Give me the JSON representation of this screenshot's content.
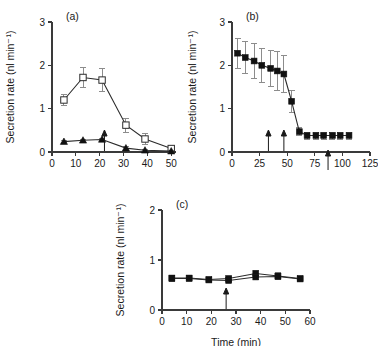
{
  "figure": {
    "axis_label_y": "Secretion rate (nl min⁻¹)",
    "axis_label_x": "Time (min)",
    "panels": [
      "(a)",
      "(b)",
      "(c)"
    ]
  },
  "chart_data": [
    {
      "type": "line",
      "panel": "(a)",
      "title": "(a)",
      "xlabel": "",
      "ylabel": "Secretion rate (nl min⁻¹)",
      "xlim": [
        0,
        52
      ],
      "ylim": [
        0,
        3
      ],
      "xticks": [
        0,
        10,
        20,
        30,
        40,
        50
      ],
      "yticks": [
        0,
        1,
        2,
        3
      ],
      "grid": false,
      "legend": "none",
      "annotations": [
        {
          "kind": "arrow",
          "x": 22,
          "direction": "up",
          "y_base": 0.0
        }
      ],
      "series": [
        {
          "name": "open-square",
          "marker": "open-square",
          "x": [
            5,
            13,
            21,
            31,
            39,
            50
          ],
          "values": [
            1.2,
            1.72,
            1.66,
            0.62,
            0.3,
            0.08
          ],
          "err": [
            0.12,
            0.22,
            0.26,
            0.16,
            0.12,
            0.05
          ]
        },
        {
          "name": "filled-triangle",
          "marker": "filled-triangle",
          "x": [
            5,
            13,
            21,
            31,
            39,
            50
          ],
          "values": [
            0.24,
            0.27,
            0.29,
            0.09,
            0.04,
            0.02
          ],
          "err": [
            0.03,
            0.03,
            0.03,
            0.03,
            0.02,
            0.02
          ]
        }
      ]
    },
    {
      "type": "line",
      "panel": "(b)",
      "title": "(b)",
      "xlabel": "",
      "ylabel": "Secretion rate (nl min⁻¹)",
      "xlim": [
        0,
        125
      ],
      "ylim": [
        0,
        3
      ],
      "xticks": [
        0,
        25,
        50,
        75,
        100,
        125
      ],
      "yticks": [
        0,
        1,
        2,
        3
      ],
      "grid": false,
      "legend": "none",
      "annotations": [
        {
          "kind": "arrow",
          "x": 33,
          "direction": "up",
          "y_base": 0.0
        },
        {
          "kind": "arrow",
          "x": 47,
          "direction": "up",
          "y_base": 0.0
        },
        {
          "kind": "arrow",
          "x": 87,
          "direction": "down",
          "y_base": 0.0
        }
      ],
      "series": [
        {
          "name": "filled-square",
          "marker": "filled-square",
          "x": [
            5,
            12,
            20,
            27,
            35,
            41,
            47,
            54,
            61,
            68,
            76,
            83,
            91,
            98,
            106
          ],
          "values": [
            2.28,
            2.18,
            2.1,
            2.0,
            1.93,
            1.87,
            1.8,
            1.17,
            0.47,
            0.38,
            0.38,
            0.38,
            0.38,
            0.38,
            0.38
          ],
          "err": [
            0.35,
            0.37,
            0.4,
            0.4,
            0.42,
            0.45,
            0.42,
            0.25,
            0.1,
            0.08,
            0.08,
            0.08,
            0.08,
            0.08,
            0.08
          ]
        }
      ]
    },
    {
      "type": "line",
      "panel": "(c)",
      "title": "(c)",
      "xlabel": "Time (min)",
      "ylabel": "Secretion rate (nl min⁻¹)",
      "xlim": [
        0,
        60
      ],
      "ylim": [
        0,
        2
      ],
      "xticks": [
        0,
        10,
        20,
        30,
        40,
        50,
        60
      ],
      "yticks": [
        0,
        1,
        2
      ],
      "grid": false,
      "legend": "none",
      "annotations": [
        {
          "kind": "arrow",
          "x": 26,
          "direction": "up",
          "y_base": 0.0
        }
      ],
      "series": [
        {
          "name": "filled-square-upper",
          "marker": "filled-square",
          "x": [
            4,
            11,
            19,
            27,
            38,
            47,
            56
          ],
          "values": [
            0.64,
            0.64,
            0.61,
            0.63,
            0.73,
            0.68,
            0.63
          ],
          "err": [
            0.06,
            0.04,
            0.04,
            0.05,
            0.07,
            0.07,
            0.05
          ]
        },
        {
          "name": "filled-square-lower",
          "marker": "filled-square",
          "x": [
            4,
            11,
            19,
            27,
            38,
            47,
            56
          ],
          "values": [
            0.63,
            0.63,
            0.6,
            0.59,
            0.66,
            0.67,
            0.62
          ],
          "err": [
            0.05,
            0.04,
            0.04,
            0.04,
            0.05,
            0.05,
            0.04
          ]
        }
      ]
    }
  ]
}
